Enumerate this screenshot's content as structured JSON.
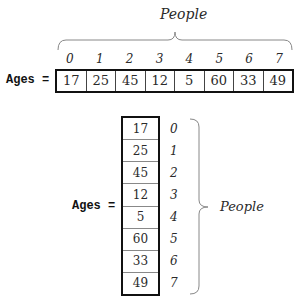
{
  "horizontal_diagram": {
    "group_label": "People",
    "array_label": "Ages =",
    "indices": [
      "0",
      "1",
      "2",
      "3",
      "4",
      "5",
      "6",
      "7"
    ],
    "values": [
      "17",
      "25",
      "45",
      "12",
      "5",
      "60",
      "33",
      "49"
    ]
  },
  "vertical_diagram": {
    "group_label": "People",
    "array_label": "Ages =",
    "indices": [
      "0",
      "1",
      "2",
      "3",
      "4",
      "5",
      "6",
      "7"
    ],
    "values": [
      "17",
      "25",
      "45",
      "12",
      "5",
      "60",
      "33",
      "49"
    ]
  },
  "colors": {
    "border": "#111111",
    "text": "#2a2a2a",
    "brace": "#888888"
  }
}
